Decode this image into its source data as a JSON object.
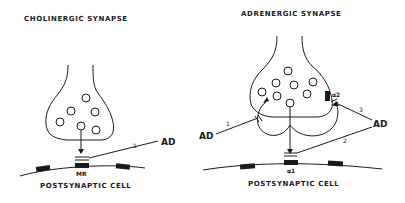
{
  "left_panel": {
    "title": "CHOLINERGIC SYNAPSE",
    "receptor_label": "MR",
    "agonist_label": "AD",
    "path_number": "1",
    "cell_label": "POSTSYNAPTIC CELL"
  },
  "right_panel": {
    "title": "ADRENERGIC SYNAPSE",
    "postsynaptic_receptor_label": "α1",
    "presynaptic_receptor_label": "α2",
    "agonist_left_label": "AD",
    "agonist_right_label": "AD",
    "path_numbers": [
      "1",
      "2",
      "3"
    ],
    "cell_label": "POSTSYNAPTIC CELL"
  },
  "colors": {
    "ink": "#1a1a1a",
    "background": "#ffffff"
  }
}
